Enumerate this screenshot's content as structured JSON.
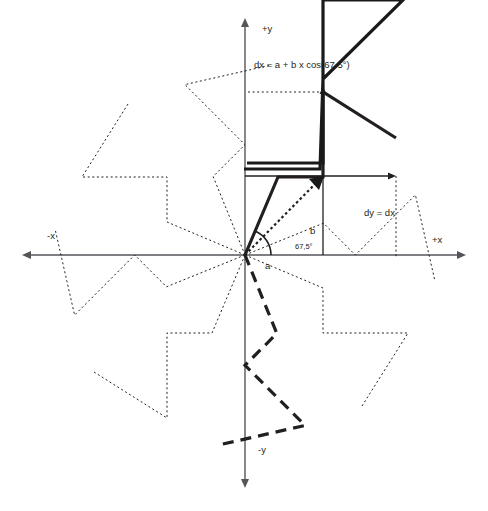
{
  "figure": {
    "kind": "geometric-construction-diagram",
    "background": "#ffffff",
    "ink": "#231f20",
    "axes": {
      "label_pos_y": "+y",
      "label_neg_y": "-y",
      "label_pos_x": "+x",
      "label_neg_x": "-x",
      "origin_px": [
        245,
        255
      ],
      "x_extent_px": [
        22,
        466
      ],
      "y_extent_px": [
        18,
        488
      ],
      "stroke": "#55565a",
      "stroke_width": 1.4
    },
    "annotations": {
      "formula": "dx = a + b x cos(67.5°)",
      "formula_pos_px": [
        254,
        63
      ],
      "dy_label": "dy = dx",
      "dy_label_pos_px": [
        364,
        212
      ],
      "a_label": "a",
      "a_label_pos_px": [
        266,
        265
      ],
      "b_label": "b",
      "b_label_pos_px": [
        311,
        230
      ],
      "angle_label": "67,5°",
      "angle_label_pos_px": [
        296,
        246
      ],
      "angle_degrees": 67.5
    },
    "guides": {
      "color": "#231f20",
      "dotted_dash": "2,2.6",
      "width": 1.0,
      "vertical_dx_arrow": {
        "x": 323,
        "y_from": 255,
        "y_to": 86
      },
      "horizontal_dy_arrow": {
        "y": 176,
        "x_from": 245,
        "x_to": 396
      },
      "dx_tick_dotted": {
        "y": 92,
        "x_from": 248,
        "x_to": 323
      },
      "dy_tick_dotted": {
        "x": 396,
        "y_from": 176,
        "y_to": 258
      }
    },
    "star": {
      "description": "8-fold rotationally symmetric spiral arms about the origin",
      "arm_count": 8,
      "rotation_step_degrees": 45,
      "styles": {
        "solid": {
          "width": 3.2,
          "dash": "none"
        },
        "dashed": {
          "width": 3.2,
          "dash": "11,7"
        },
        "dotted": {
          "width": 1.0,
          "dash": "2,2.6"
        }
      },
      "arm_style_by_index": [
        "solid",
        "dotted",
        "dotted",
        "dashed",
        "dotted",
        "dotted",
        "dotted",
        "dotted"
      ],
      "arm_points_px": [
        [
          0,
          0
        ],
        [
          33,
          -78
        ],
        [
          78,
          -78
        ],
        [
          78,
          -163
        ],
        [
          151,
          -117
        ]
      ]
    },
    "solid_overlay": {
      "note": "thick solid polyline forming the primary construction arm and its neighbour",
      "points_px": [
        [
          -1,
          86
        ],
        [
          75,
          86
        ],
        [
          78,
          176
        ],
        [
          78,
          255
        ],
        [
          158,
          255
        ],
        [
          78,
          176
        ],
        [
          78,
          92
        ],
        [
          2,
          92
        ]
      ]
    }
  }
}
